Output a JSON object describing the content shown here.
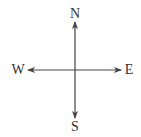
{
  "diagram": {
    "type": "compass-rose",
    "center": {
      "x": 75,
      "y": 70
    },
    "line_color": "#444444",
    "label_color": "#333333",
    "directions": {
      "north": {
        "label": "N",
        "x": 75,
        "y": 14
      },
      "south": {
        "label": "S",
        "x": 75,
        "y": 127
      },
      "west": {
        "label": "W",
        "x": 18,
        "y": 70
      },
      "east": {
        "label": "E",
        "x": 129,
        "y": 70
      }
    }
  }
}
